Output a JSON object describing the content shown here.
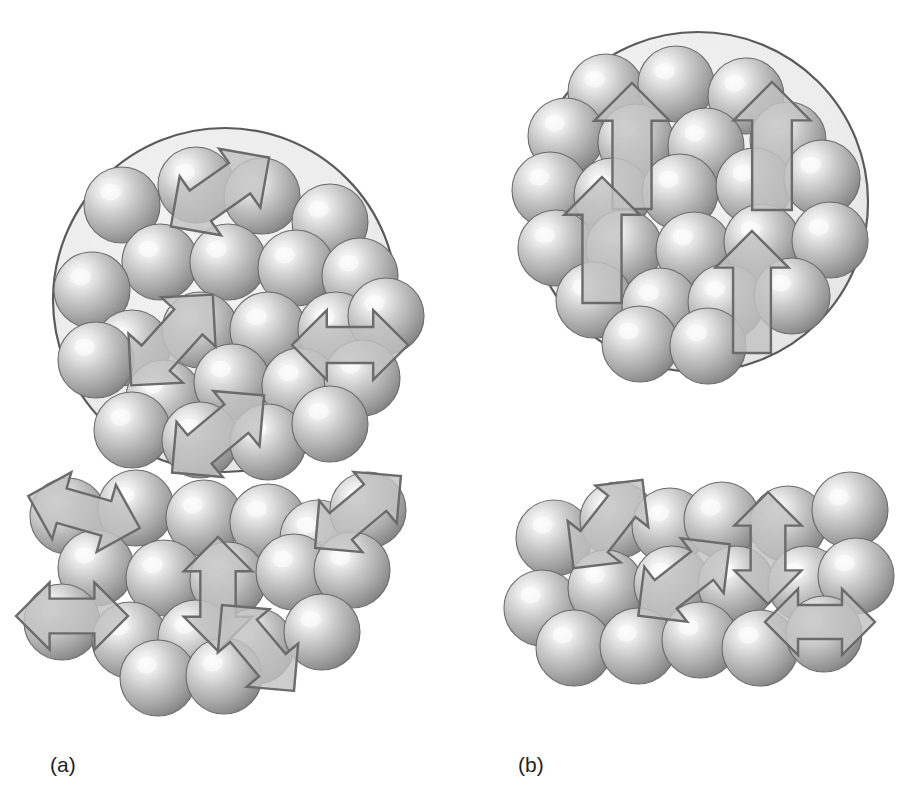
{
  "figure": {
    "background_color": "#ffffff",
    "width": 904,
    "height": 801,
    "captions": {
      "panel_a": "(a)",
      "panel_b": "(b)"
    }
  },
  "colors": {
    "sphere_highlight": "#f4f4f4",
    "sphere_mid": "#b4b4b4",
    "sphere_edge": "#6f6f6f",
    "sphere_outline": "#6b6b6b",
    "domain_fill": "#ededed",
    "domain_stroke": "#5a5a5a",
    "arrow_fill": "#c2c2c2",
    "arrow_stroke": "#6b6b6b",
    "caption_color": "#231f20",
    "background": "#ffffff"
  },
  "geometry": {
    "sphere_radius": 38,
    "arrow_stroke_width": 2.4,
    "domain_stroke_width": 2.2
  },
  "panels": [
    {
      "id": "panel-a",
      "label": "(a)",
      "label_x": 50,
      "label_y": 772,
      "state": "randomly oriented magnetic moments",
      "domain_circle": {
        "cx": 225,
        "cy": 300,
        "r": 172
      },
      "circle_spheres": [
        {
          "cx": 122,
          "cy": 205
        },
        {
          "cx": 196,
          "cy": 185
        },
        {
          "cx": 262,
          "cy": 196
        },
        {
          "cx": 330,
          "cy": 222
        },
        {
          "cx": 160,
          "cy": 262
        },
        {
          "cx": 228,
          "cy": 262
        },
        {
          "cx": 296,
          "cy": 268
        },
        {
          "cx": 360,
          "cy": 276
        },
        {
          "cx": 92,
          "cy": 290
        },
        {
          "cx": 132,
          "cy": 348
        },
        {
          "cx": 200,
          "cy": 330
        },
        {
          "cx": 268,
          "cy": 330
        },
        {
          "cx": 336,
          "cy": 330
        },
        {
          "cx": 386,
          "cy": 316
        },
        {
          "cx": 96,
          "cy": 360
        },
        {
          "cx": 164,
          "cy": 398
        },
        {
          "cx": 232,
          "cy": 382
        },
        {
          "cx": 300,
          "cy": 386
        },
        {
          "cx": 362,
          "cy": 378
        },
        {
          "cx": 132,
          "cy": 430
        },
        {
          "cx": 200,
          "cy": 440
        },
        {
          "cx": 268,
          "cy": 442
        },
        {
          "cx": 330,
          "cy": 424
        }
      ],
      "circle_arrows": [
        {
          "cx": 220,
          "cy": 192,
          "angle": -35,
          "length": 120,
          "head": "double"
        },
        {
          "cx": 172,
          "cy": 340,
          "angle": 132,
          "length": 122,
          "head": "double"
        },
        {
          "cx": 350,
          "cy": 345,
          "angle": 180,
          "length": 116,
          "head": "double"
        },
        {
          "cx": 218,
          "cy": 434,
          "angle": 140,
          "length": 120,
          "head": "double"
        }
      ],
      "cluster_spheres": [
        {
          "cx": 68,
          "cy": 516
        },
        {
          "cx": 136,
          "cy": 508
        },
        {
          "cx": 204,
          "cy": 518
        },
        {
          "cx": 268,
          "cy": 522
        },
        {
          "cx": 318,
          "cy": 538
        },
        {
          "cx": 368,
          "cy": 510
        },
        {
          "cx": 96,
          "cy": 568
        },
        {
          "cx": 164,
          "cy": 578
        },
        {
          "cx": 228,
          "cy": 580
        },
        {
          "cx": 294,
          "cy": 572
        },
        {
          "cx": 352,
          "cy": 570
        },
        {
          "cx": 62,
          "cy": 622
        },
        {
          "cx": 130,
          "cy": 640
        },
        {
          "cx": 196,
          "cy": 638
        },
        {
          "cx": 256,
          "cy": 646
        },
        {
          "cx": 322,
          "cy": 632
        },
        {
          "cx": 158,
          "cy": 678
        },
        {
          "cx": 224,
          "cy": 676
        }
      ],
      "cluster_arrows": [
        {
          "cx": 84,
          "cy": 512,
          "angle": 196,
          "length": 116,
          "head": "double"
        },
        {
          "cx": 358,
          "cy": 512,
          "angle": -40,
          "length": 112,
          "head": "double"
        },
        {
          "cx": 218,
          "cy": 594,
          "angle": -90,
          "length": 114,
          "head": "double"
        },
        {
          "cx": 72,
          "cy": 616,
          "angle": 180,
          "length": 112,
          "head": "double"
        },
        {
          "cx": 258,
          "cy": 648,
          "angle": 50,
          "length": 112,
          "head": "double"
        }
      ]
    },
    {
      "id": "panel-b",
      "label": "(b)",
      "label_x": 518,
      "label_y": 772,
      "state": "aligned magnetic moments",
      "domain_circle": {
        "cx": 698,
        "cy": 202,
        "r": 170
      },
      "circle_spheres": [
        {
          "cx": 606,
          "cy": 92
        },
        {
          "cx": 676,
          "cy": 84
        },
        {
          "cx": 746,
          "cy": 96
        },
        {
          "cx": 566,
          "cy": 136
        },
        {
          "cx": 636,
          "cy": 142
        },
        {
          "cx": 706,
          "cy": 146
        },
        {
          "cx": 788,
          "cy": 140
        },
        {
          "cx": 550,
          "cy": 190
        },
        {
          "cx": 612,
          "cy": 196
        },
        {
          "cx": 680,
          "cy": 192
        },
        {
          "cx": 754,
          "cy": 186
        },
        {
          "cx": 822,
          "cy": 178
        },
        {
          "cx": 556,
          "cy": 248
        },
        {
          "cx": 624,
          "cy": 248
        },
        {
          "cx": 694,
          "cy": 250
        },
        {
          "cx": 762,
          "cy": 242
        },
        {
          "cx": 830,
          "cy": 240
        },
        {
          "cx": 594,
          "cy": 300
        },
        {
          "cx": 660,
          "cy": 306
        },
        {
          "cx": 726,
          "cy": 302
        },
        {
          "cx": 792,
          "cy": 296
        },
        {
          "cx": 640,
          "cy": 344
        },
        {
          "cx": 708,
          "cy": 346
        }
      ],
      "circle_arrows": [
        {
          "cx": 632,
          "cy": 146,
          "angle": -90,
          "length": 126,
          "head": "single"
        },
        {
          "cx": 772,
          "cy": 146,
          "angle": -90,
          "length": 128,
          "head": "single"
        },
        {
          "cx": 602,
          "cy": 240,
          "angle": -90,
          "length": 126,
          "head": "single"
        },
        {
          "cx": 752,
          "cy": 292,
          "angle": -90,
          "length": 122,
          "head": "single"
        }
      ],
      "cluster_spheres": [
        {
          "cx": 554,
          "cy": 538
        },
        {
          "cx": 618,
          "cy": 520
        },
        {
          "cx": 670,
          "cy": 526
        },
        {
          "cx": 722,
          "cy": 520
        },
        {
          "cx": 788,
          "cy": 524
        },
        {
          "cx": 850,
          "cy": 510
        },
        {
          "cx": 542,
          "cy": 608
        },
        {
          "cx": 606,
          "cy": 588
        },
        {
          "cx": 672,
          "cy": 584
        },
        {
          "cx": 736,
          "cy": 584
        },
        {
          "cx": 806,
          "cy": 584
        },
        {
          "cx": 856,
          "cy": 576
        },
        {
          "cx": 574,
          "cy": 648
        },
        {
          "cx": 638,
          "cy": 646
        },
        {
          "cx": 700,
          "cy": 640
        },
        {
          "cx": 760,
          "cy": 648
        },
        {
          "cx": 824,
          "cy": 634
        }
      ],
      "cluster_arrows": [
        {
          "cx": 608,
          "cy": 524,
          "angle": -52,
          "length": 112,
          "head": "double"
        },
        {
          "cx": 684,
          "cy": 580,
          "angle": 142,
          "length": 116,
          "head": "double"
        },
        {
          "cx": 768,
          "cy": 548,
          "angle": -90,
          "length": 112,
          "head": "double"
        },
        {
          "cx": 820,
          "cy": 622,
          "angle": 0,
          "length": 110,
          "head": "double"
        }
      ]
    }
  ],
  "chart_data": {
    "type": "diagram",
    "panels": [
      {
        "label": "(a)",
        "domain_spheres": 23,
        "domain_arrows": 4,
        "domain_arrow_directions_deg": [
          -35,
          132,
          180,
          140
        ],
        "cluster_spheres": 18,
        "cluster_arrows": 5,
        "cluster_arrow_directions_deg": [
          196,
          -40,
          -90,
          180,
          50
        ],
        "arrow_style": "double-headed",
        "alignment": "random"
      },
      {
        "label": "(b)",
        "domain_spheres": 23,
        "domain_arrows": 4,
        "domain_arrow_directions_deg": [
          -90,
          -90,
          -90,
          -90
        ],
        "cluster_spheres": 17,
        "cluster_arrows": 4,
        "cluster_arrow_directions_deg": [
          -52,
          142,
          -90,
          0
        ],
        "arrow_style": "single-headed in domain, double-headed in cluster",
        "alignment": "aligned upward"
      }
    ]
  }
}
